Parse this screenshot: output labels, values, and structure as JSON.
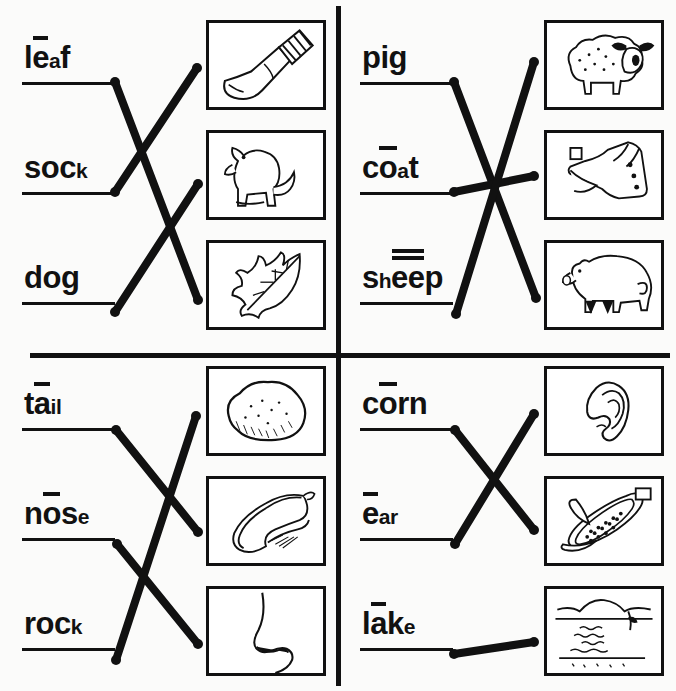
{
  "worksheet": {
    "title": "Long and short vowel picture matching worksheet",
    "ink_color": "#111111",
    "paper_color": "#fbfbfa"
  },
  "quadrants": [
    {
      "id": "top-left",
      "words": [
        {
          "text": "leaf",
          "parts": [
            {
              "t": "l",
              "s": "big"
            },
            {
              "t": "e",
              "s": "big",
              "macron": 1
            },
            {
              "t": "a",
              "s": "small"
            },
            {
              "t": "f",
              "s": "big"
            }
          ]
        },
        {
          "text": "sock",
          "parts": [
            {
              "t": "s",
              "s": "big"
            },
            {
              "t": "o",
              "s": "big"
            },
            {
              "t": "c",
              "s": "big"
            },
            {
              "t": "k",
              "s": "small"
            }
          ]
        },
        {
          "text": "dog",
          "parts": [
            {
              "t": "d",
              "s": "big"
            },
            {
              "t": "o",
              "s": "big"
            },
            {
              "t": "g",
              "s": "big"
            }
          ]
        }
      ],
      "pictures": [
        "sock",
        "dog",
        "leaf"
      ],
      "matches": [
        {
          "from_word": "leaf",
          "to_picture": "leaf"
        },
        {
          "from_word": "sock",
          "to_picture": "sock"
        },
        {
          "from_word": "dog",
          "to_picture": "dog"
        }
      ]
    },
    {
      "id": "top-right",
      "words": [
        {
          "text": "pig",
          "parts": [
            {
              "t": "p",
              "s": "big"
            },
            {
              "t": "i",
              "s": "big"
            },
            {
              "t": "g",
              "s": "big"
            }
          ]
        },
        {
          "text": "coat",
          "parts": [
            {
              "t": "c",
              "s": "big"
            },
            {
              "t": "o",
              "s": "big",
              "macron": 1
            },
            {
              "t": "a",
              "s": "small"
            },
            {
              "t": "t",
              "s": "big"
            }
          ]
        },
        {
          "text": "sheep",
          "parts": [
            {
              "t": "s",
              "s": "big"
            },
            {
              "t": "h",
              "s": "small"
            },
            {
              "t": "ee",
              "s": "big",
              "macron": 2
            },
            {
              "t": "p",
              "s": "big"
            }
          ]
        }
      ],
      "pictures": [
        "sheep",
        "coat",
        "pig"
      ],
      "matches": [
        {
          "from_word": "pig",
          "to_picture": "pig"
        },
        {
          "from_word": "coat",
          "to_picture": "coat"
        },
        {
          "from_word": "sheep",
          "to_picture": "sheep"
        }
      ]
    },
    {
      "id": "bottom-left",
      "words": [
        {
          "text": "tail",
          "parts": [
            {
              "t": "t",
              "s": "big"
            },
            {
              "t": "a",
              "s": "big",
              "macron": 1
            },
            {
              "t": "i",
              "s": "small"
            },
            {
              "t": "l",
              "s": "small"
            }
          ]
        },
        {
          "text": "nose",
          "parts": [
            {
              "t": "n",
              "s": "big"
            },
            {
              "t": "o",
              "s": "big",
              "macron": 1
            },
            {
              "t": "s",
              "s": "big"
            },
            {
              "t": "e",
              "s": "small"
            }
          ]
        },
        {
          "text": "rock",
          "parts": [
            {
              "t": "r",
              "s": "big"
            },
            {
              "t": "o",
              "s": "big"
            },
            {
              "t": "c",
              "s": "big"
            },
            {
              "t": "k",
              "s": "small"
            }
          ]
        }
      ],
      "pictures": [
        "rock",
        "tail",
        "nose"
      ],
      "matches": [
        {
          "from_word": "tail",
          "to_picture": "tail"
        },
        {
          "from_word": "nose",
          "to_picture": "nose"
        },
        {
          "from_word": "rock",
          "to_picture": "rock"
        }
      ]
    },
    {
      "id": "bottom-right",
      "words": [
        {
          "text": "corn",
          "parts": [
            {
              "t": "c",
              "s": "big"
            },
            {
              "t": "o",
              "s": "big",
              "macron": 1
            },
            {
              "t": "r",
              "s": "big"
            },
            {
              "t": "n",
              "s": "big"
            }
          ]
        },
        {
          "text": "ear",
          "parts": [
            {
              "t": "e",
              "s": "big",
              "macron": 1
            },
            {
              "t": "a",
              "s": "small"
            },
            {
              "t": "r",
              "s": "small"
            }
          ]
        },
        {
          "text": "lake",
          "parts": [
            {
              "t": "l",
              "s": "big"
            },
            {
              "t": "a",
              "s": "big",
              "macron": 1
            },
            {
              "t": "k",
              "s": "big"
            },
            {
              "t": "e",
              "s": "small"
            }
          ]
        }
      ],
      "pictures": [
        "ear",
        "corn",
        "lake"
      ],
      "matches": [
        {
          "from_word": "corn",
          "to_picture": "corn"
        },
        {
          "from_word": "ear",
          "to_picture": "ear"
        },
        {
          "from_word": "lake",
          "to_picture": "lake"
        }
      ]
    }
  ]
}
